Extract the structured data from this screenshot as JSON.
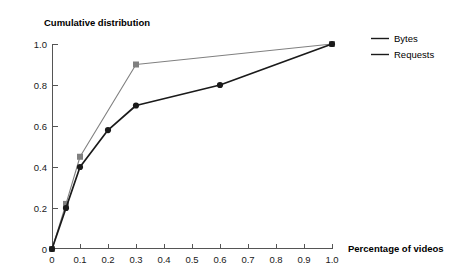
{
  "chart_data": {
    "type": "line",
    "title": "Cumulative distribution",
    "xlabel": "Percentage of videos",
    "ylabel": "",
    "xlim": [
      0,
      1.0
    ],
    "ylim": [
      0,
      1.0
    ],
    "grid": false,
    "legend_position": "right",
    "xticks": [
      "0",
      "0.1",
      "0.2",
      "0.3",
      "0.4",
      "0.5",
      "0.6",
      "0.7",
      "0.8",
      "0.9",
      "1.0"
    ],
    "xtick_values": [
      0,
      0.1,
      0.2,
      0.3,
      0.4,
      0.5,
      0.6,
      0.7,
      0.8,
      0.9,
      1.0
    ],
    "yticks": [
      "0",
      "0.2",
      "0.4",
      "0.6",
      "0.8",
      "1.0"
    ],
    "ytick_values": [
      0,
      0.2,
      0.4,
      0.6,
      0.8,
      1.0
    ],
    "series": [
      {
        "name": "Bytes",
        "color": "#808080",
        "marker": "square",
        "x": [
          0,
          0.05,
          0.1,
          0.3,
          1.0
        ],
        "y": [
          0,
          0.22,
          0.45,
          0.9,
          1.0
        ]
      },
      {
        "name": "Requests",
        "color": "#1a1a1a",
        "marker": "circle",
        "x": [
          0,
          0.05,
          0.1,
          0.2,
          0.3,
          0.6,
          1.0
        ],
        "y": [
          0,
          0.2,
          0.4,
          0.58,
          0.7,
          0.8,
          1.0
        ]
      }
    ]
  },
  "legend": {
    "entries": [
      {
        "label": "Bytes"
      },
      {
        "label": "Requests"
      }
    ]
  },
  "colors": {
    "bytes": "#808080",
    "requests": "#1a1a1a",
    "axis": "#555555",
    "background": "#ffffff"
  }
}
